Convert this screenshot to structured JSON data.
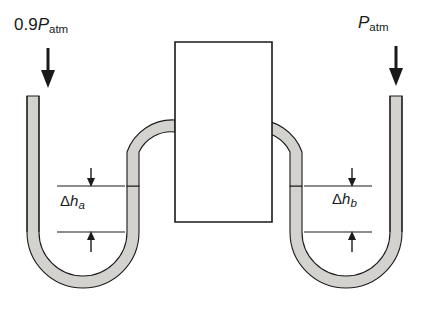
{
  "figure": {
    "colors": {
      "stroke": "#1a1a1a",
      "mercury_fill": "#d4d2cf",
      "background": "#ffffff"
    },
    "labels": {
      "pressure_left": {
        "coefficient": "0.9",
        "symbol": "P",
        "subscript": "atm"
      },
      "pressure_right": {
        "coefficient": "",
        "symbol": "P",
        "subscript": "atm"
      },
      "height_a": {
        "delta": "Δ",
        "symbol": "h",
        "subscript": "a"
      },
      "height_b": {
        "delta": "Δ",
        "symbol": "h",
        "subscript": "b"
      }
    },
    "arrows": {
      "left_pressure_direction": "down",
      "right_pressure_direction": "down",
      "height_a_top": "down",
      "height_a_bottom": "up",
      "height_b_top": "down",
      "height_b_bottom": "up"
    },
    "parts": {
      "duct": "central-rectangular-duct",
      "left_manometer": "u-tube-left",
      "right_manometer": "u-tube-right",
      "fluid": "mercury"
    }
  }
}
